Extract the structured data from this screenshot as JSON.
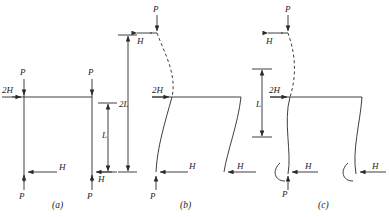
{
  "figure": {
    "stroke_color": "#2a2a2a",
    "background": "#ffffff",
    "panels": [
      {
        "id": "a",
        "caption": "(a)",
        "description": "Undeformed two-column frame with vertical loads P and horizontal loads H, 2H",
        "loads": [
          {
            "name": "P",
            "position": "top-left-column"
          },
          {
            "name": "P",
            "position": "top-right-column"
          },
          {
            "name": "2H",
            "position": "beam-left-joint"
          },
          {
            "name": "H",
            "position": "base-left-column"
          },
          {
            "name": "P",
            "position": "base-left-column"
          },
          {
            "name": "H",
            "position": "base-right-column"
          },
          {
            "name": "P",
            "position": "base-right-column"
          }
        ],
        "dimensions": [
          {
            "label": "L",
            "description": "storey height, beam to base"
          },
          {
            "label": "2L",
            "description": "total height, top to base"
          }
        ]
      },
      {
        "id": "b",
        "caption": "(b)",
        "description": "Buckled frame, pinned bases, sidesway mode with dashed upper column",
        "loads": [
          {
            "name": "P",
            "position": "top-of-left-column"
          },
          {
            "name": "H",
            "position": "top-of-left-column"
          },
          {
            "name": "2H",
            "position": "beam-left-joint"
          },
          {
            "name": "H",
            "position": "base-left-column"
          },
          {
            "name": "P",
            "position": "base-left-column"
          },
          {
            "name": "H",
            "position": "base-right-column"
          }
        ]
      },
      {
        "id": "c",
        "caption": "(c)",
        "description": "Buckled frame, fixed bases with rotation arcs at supports",
        "loads": [
          {
            "name": "P",
            "position": "top-of-left-column"
          },
          {
            "name": "H",
            "position": "top-of-left-column"
          },
          {
            "name": "2H",
            "position": "beam-left-joint"
          },
          {
            "name": "H",
            "position": "base-left-column"
          },
          {
            "name": "P",
            "position": "base-left-column"
          },
          {
            "name": "H",
            "position": "base-right-column"
          }
        ],
        "dimensions": [
          {
            "label": "L",
            "description": "upper storey height"
          }
        ]
      }
    ],
    "labels": {
      "P": "P",
      "H": "H",
      "H2": "2H",
      "L": "L",
      "L2": "2L",
      "cap_a": "(a)",
      "cap_b": "(b)",
      "cap_c": "(c)"
    }
  }
}
